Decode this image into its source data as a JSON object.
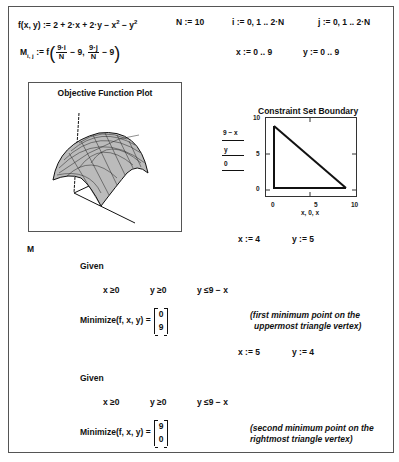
{
  "worksheet": {
    "definitions": {
      "function_def": "f(x, y) := 2 + 2·x + 2·y − x",
      "function_def_tail": " − y",
      "exp": "2",
      "n_def": "N := 10",
      "i_def": "i := 0, 1 .. 2·N",
      "j_def": "j := 0, 1 .. 2·N",
      "m_def_left": "M",
      "m_sub": "i, j",
      "m_def_mid": " := f",
      "frac1_num": "9·i",
      "frac1_den": "N",
      "minus9a": " − 9, ",
      "frac2_num": "9·j",
      "frac2_den": "N",
      "minus9b": " − 9",
      "x_range": "x := 0 .. 9",
      "y_range": "y := 0 .. 9"
    },
    "surface_plot": {
      "title": "Objective Function Plot",
      "data_label": "M"
    },
    "constraint_plot": {
      "title": "Constraint Set Boundary",
      "legend": [
        "9 − x",
        "y",
        "0"
      ],
      "x_label": "x, 0, x",
      "x_ticks": [
        "0",
        "5",
        "10"
      ],
      "y_ticks": [
        "10",
        "5",
        "0"
      ]
    },
    "solve1": {
      "guess_x": "x := 4",
      "guess_y": "y := 5",
      "given": "Given",
      "c1": "x ≥0",
      "c2": "y ≥0",
      "c3": "y ≤9 − x",
      "minimize": "Minimize(f, x, y) =",
      "result": [
        "0",
        "9"
      ],
      "note_line1": "(first minimum point on the",
      "note_line2": "uppermost triangle vertex)"
    },
    "solve2": {
      "guess_x": "x := 5",
      "guess_y": "y := 4",
      "given": "Given",
      "c1": "x ≥0",
      "c2": "y ≥0",
      "c3": "y ≤9 − x",
      "minimize": "Minimize(f, x, y) =",
      "result": [
        "9",
        "0"
      ],
      "note_line1": "(second minimum point on the",
      "note_line2": "rightmost triangle vertex)"
    }
  }
}
